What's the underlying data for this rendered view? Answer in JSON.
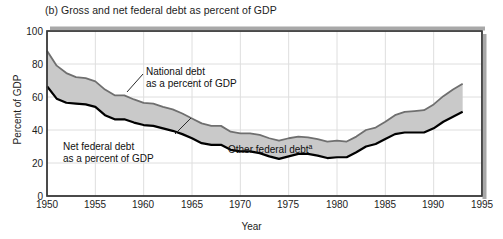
{
  "figure": {
    "title": "(b) Gross and net federal debt as percent of GDP",
    "xlabel": "Year",
    "ylabel": "Percent of GDP"
  },
  "annotations": {
    "national_debt_line1": "National debt",
    "national_debt_line2": "as a percent of GDP",
    "net_debt_line1": "Net federal debt",
    "net_debt_line2": "as a percent of GDP",
    "other_debt": "Other federal debt",
    "other_debt_superscript": "a"
  },
  "colors": {
    "fill": "#c9c9c9",
    "gross_line": "#6f6f6f",
    "net_line": "#000000",
    "grid": "#dedede",
    "frame": "#3a3a3a",
    "text": "#1d1d1d"
  },
  "chart_data": {
    "type": "area",
    "title": "(b) Gross and net federal debt as percent of GDP",
    "xlabel": "Year",
    "ylabel": "Percent of GDP",
    "xlim": [
      1950,
      1995
    ],
    "ylim": [
      0,
      100
    ],
    "xticks": [
      1950,
      1955,
      1960,
      1965,
      1970,
      1975,
      1980,
      1985,
      1990,
      1995
    ],
    "yticks": [
      0,
      20,
      40,
      60,
      80,
      100
    ],
    "grid": true,
    "legend": "annotations-inline",
    "x": [
      1950,
      1951,
      1952,
      1953,
      1954,
      1955,
      1956,
      1957,
      1958,
      1959,
      1960,
      1961,
      1962,
      1963,
      1964,
      1965,
      1966,
      1967,
      1968,
      1969,
      1970,
      1971,
      1972,
      1973,
      1974,
      1975,
      1976,
      1977,
      1978,
      1979,
      1980,
      1981,
      1982,
      1983,
      1984,
      1985,
      1986,
      1987,
      1988,
      1989,
      1990,
      1991,
      1992,
      1993
    ],
    "series": [
      {
        "name": "National debt as a percent of GDP",
        "label": "gross",
        "values": [
          88.0,
          79.0,
          74.5,
          72.0,
          71.5,
          69.5,
          64.5,
          61.0,
          61.0,
          58.5,
          56.5,
          56.0,
          54.0,
          52.5,
          50.0,
          47.0,
          44.0,
          42.5,
          42.5,
          39.0,
          38.0,
          38.0,
          37.0,
          35.0,
          33.5,
          35.0,
          36.0,
          35.5,
          34.5,
          33.0,
          33.5,
          33.0,
          36.0,
          40.0,
          41.5,
          45.0,
          49.0,
          51.0,
          51.5,
          52.0,
          55.5,
          60.5,
          64.5,
          68.0
        ]
      },
      {
        "name": "Net federal debt as a percent of GDP",
        "label": "net",
        "values": [
          66.5,
          59.0,
          56.5,
          56.0,
          55.5,
          54.0,
          49.0,
          46.5,
          46.5,
          44.5,
          43.0,
          42.5,
          41.0,
          39.5,
          37.5,
          35.0,
          32.0,
          31.0,
          31.0,
          28.0,
          27.0,
          27.0,
          26.0,
          24.0,
          22.5,
          24.0,
          25.5,
          25.5,
          24.5,
          23.0,
          23.5,
          23.5,
          26.5,
          30.0,
          31.5,
          34.5,
          37.5,
          38.5,
          38.5,
          38.5,
          41.0,
          45.0,
          48.0,
          51.0
        ]
      }
    ],
    "derived_series": {
      "name": "Other federal debt",
      "description": "Shaded band between the national (gross) debt curve and the net federal debt curve"
    }
  }
}
